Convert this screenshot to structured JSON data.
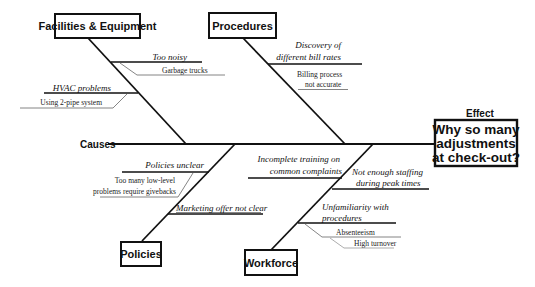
{
  "diagram": {
    "type": "fishbone",
    "causes_label": "Causes",
    "effect_label": "Effect",
    "effect": {
      "lines": [
        "Why so many",
        "adjustments",
        "at check-out?"
      ]
    },
    "categories": [
      {
        "name": "Facilities & Equipment",
        "causes": [
          {
            "text": "Too noisy",
            "sub": [
              "Garbage trucks"
            ]
          },
          {
            "text": "HVAC problems",
            "sub": [
              "Using 2-pipe system"
            ]
          }
        ]
      },
      {
        "name": "Procedures",
        "causes": [
          {
            "text_lines": [
              "Discovery of",
              "different bill rates"
            ],
            "sub_lines": [
              "Billing process",
              "not accurate"
            ]
          }
        ]
      },
      {
        "name": "Policies",
        "causes": [
          {
            "text": "Policies unclear",
            "sub_lines": [
              "Too many low-level",
              "problems require givebacks"
            ]
          },
          {
            "text": "Marketing offer not clear"
          }
        ]
      },
      {
        "name": "Workforce",
        "causes": [
          {
            "text_lines": [
              "Incomplete training on",
              "common complaints"
            ]
          },
          {
            "text_lines": [
              "Not enough staffing",
              "during peak times"
            ]
          },
          {
            "text_lines": [
              "Unfamiliarity with",
              "procedures"
            ],
            "sub": [
              "Absenteeism",
              "High turnover"
            ]
          }
        ]
      }
    ]
  }
}
